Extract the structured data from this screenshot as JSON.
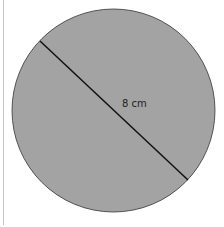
{
  "diagram": {
    "shape": "circle",
    "fill_color": "#a3a3a3",
    "stroke_color": "#333333",
    "diameter_label": "8 cm"
  }
}
